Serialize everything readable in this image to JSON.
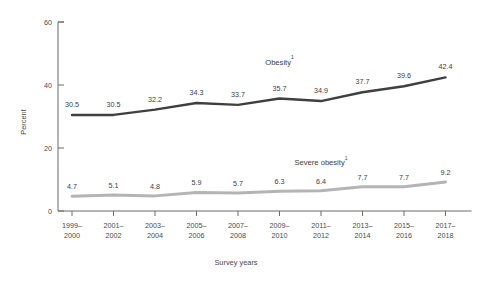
{
  "chart_data": {
    "type": "line",
    "title": "",
    "xlabel": "Survey years",
    "ylabel": "Percent",
    "ylim": [
      0,
      60
    ],
    "yticks": [
      0,
      20,
      40,
      60
    ],
    "ytick_labels": [
      "0",
      "20",
      "40",
      "60"
    ],
    "grid": false,
    "legend_position": "inline-annotation",
    "categories": [
      "1999–2000",
      "2001–2002",
      "2003–2004",
      "2005–2006",
      "2007–2008",
      "2009–2010",
      "2011–2012",
      "2013–2014",
      "2015–2016",
      "2017–2018"
    ],
    "category_lines": [
      [
        "1999–",
        "2000"
      ],
      [
        "2001–",
        "2002"
      ],
      [
        "2003–",
        "2004"
      ],
      [
        "2005–",
        "2006"
      ],
      [
        "2007–",
        "2008"
      ],
      [
        "2009–",
        "2010"
      ],
      [
        "2011–",
        "2012"
      ],
      [
        "2013–",
        "2014"
      ],
      [
        "2015–",
        "2016"
      ],
      [
        "2017–",
        "2018"
      ]
    ],
    "series": [
      {
        "name": "Obesity",
        "footnote_marker": "1",
        "color": "#3f3f3f",
        "values": [
          30.5,
          30.5,
          32.2,
          34.3,
          33.7,
          35.7,
          34.9,
          37.7,
          39.6,
          42.4
        ],
        "value_labels": [
          "30.5",
          "30.5",
          "32.2",
          "34.3",
          "33.7",
          "35.7",
          "34.9",
          "37.7",
          "39.6",
          "42.4"
        ]
      },
      {
        "name": "Severe obesity",
        "footnote_marker": "1",
        "color": "#b4b4b4",
        "values": [
          4.7,
          5.1,
          4.8,
          5.9,
          5.7,
          6.3,
          6.4,
          7.7,
          7.7,
          9.2
        ],
        "value_labels": [
          "4.7",
          "5.1",
          "4.8",
          "5.9",
          "5.7",
          "6.3",
          "6.4",
          "7.7",
          "7.7",
          "9.2"
        ]
      }
    ],
    "annotations": [
      {
        "text": "Obesity",
        "marker": "1",
        "x_index": 5,
        "value_y": 46.5
      },
      {
        "text": "Severe obesity",
        "marker": "1",
        "x_index": 6,
        "value_y": 14.5
      }
    ]
  },
  "axes": {
    "y_axis_name": "Percent",
    "x_axis_name": "Survey years"
  }
}
